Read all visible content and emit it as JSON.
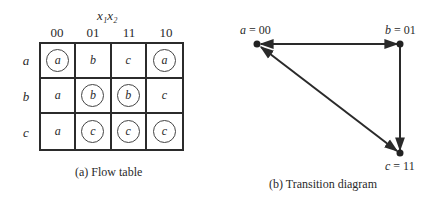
{
  "flow_table": {
    "input_label": "x₁x₂",
    "columns": [
      "00",
      "01",
      "11",
      "10"
    ],
    "rows": [
      {
        "state": "a",
        "cells": [
          {
            "value": "a",
            "stable": true
          },
          {
            "value": "b",
            "stable": false
          },
          {
            "value": "c",
            "stable": false
          },
          {
            "value": "a",
            "stable": true
          }
        ]
      },
      {
        "state": "b",
        "cells": [
          {
            "value": "a",
            "stable": false
          },
          {
            "value": "b",
            "stable": true
          },
          {
            "value": "b",
            "stable": true
          },
          {
            "value": "c",
            "stable": false
          }
        ]
      },
      {
        "state": "c",
        "cells": [
          {
            "value": "a",
            "stable": false
          },
          {
            "value": "c",
            "stable": true
          },
          {
            "value": "c",
            "stable": true
          },
          {
            "value": "c",
            "stable": true
          }
        ]
      }
    ],
    "caption": "(a)  Flow table"
  },
  "transition_diagram": {
    "nodes": [
      {
        "id": "a",
        "label_var": "a",
        "label_code": " = 00"
      },
      {
        "id": "b",
        "label_var": "b",
        "label_code": " = 01"
      },
      {
        "id": "c",
        "label_var": "c",
        "label_code": " = 11"
      }
    ],
    "edges": [
      {
        "from": "a",
        "to": "b",
        "bidirectional": true
      },
      {
        "from": "b",
        "to": "c",
        "bidirectional": false
      },
      {
        "from": "a",
        "to": "c",
        "bidirectional": true
      }
    ],
    "caption": "(b)  Transition diagram"
  }
}
